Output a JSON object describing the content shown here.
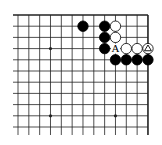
{
  "diagram": {
    "type": "go-board-diagram",
    "view": "upper-right corner section",
    "columns": 13,
    "rows": 11,
    "grid": {
      "x0": 18,
      "dx": 10.83,
      "y0": 15,
      "dy": 11.2,
      "left_extend_to": 13,
      "bottom_extend_to": 135,
      "top_edge": true,
      "right_edge": true
    },
    "colors": {
      "line": "#222222",
      "black_stone": "#000000",
      "white_stone": "#ffffff",
      "stone_outline": "#000000"
    },
    "star_points": [
      {
        "col": 3,
        "row": 3
      },
      {
        "col": 3,
        "row": 9
      },
      {
        "col": 9,
        "row": 9
      }
    ],
    "stones": [
      {
        "color": "black",
        "col": 6,
        "row": 1
      },
      {
        "color": "black",
        "col": 8,
        "row": 1
      },
      {
        "color": "white",
        "col": 9,
        "row": 1
      },
      {
        "color": "black",
        "col": 8,
        "row": 2
      },
      {
        "color": "white",
        "col": 9,
        "row": 2
      },
      {
        "color": "black",
        "col": 8,
        "row": 3
      },
      {
        "color": "white",
        "col": 10,
        "row": 3
      },
      {
        "color": "white",
        "col": 11,
        "row": 3
      },
      {
        "color": "white",
        "col": 12,
        "row": 3,
        "marker": "triangle"
      },
      {
        "color": "black",
        "col": 9,
        "row": 4
      },
      {
        "color": "black",
        "col": 10,
        "row": 4
      },
      {
        "color": "black",
        "col": 11,
        "row": 4
      },
      {
        "color": "black",
        "col": 12,
        "row": 4
      }
    ],
    "labels": [
      {
        "text": "A",
        "col": 9,
        "row": 3
      }
    ]
  }
}
